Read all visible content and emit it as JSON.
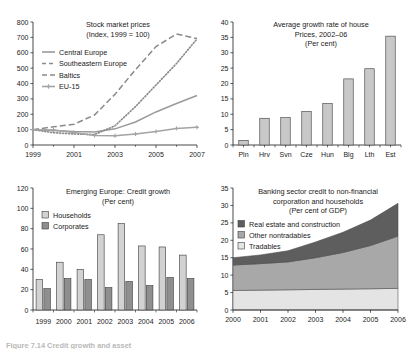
{
  "figure": {
    "caption_partial": "Figure 7.14   Credit growth and asset"
  },
  "chart_data": [
    {
      "id": "stock-market-prices",
      "type": "line",
      "title": "Stock market prices",
      "subtitle": "(Index, 1999 = 100)",
      "xlabel": "",
      "ylabel": "",
      "ylim": [
        0,
        800
      ],
      "yticks": [
        0,
        100,
        200,
        300,
        400,
        500,
        600,
        700,
        800
      ],
      "xlim": [
        1999,
        2007
      ],
      "xticks": [
        1999,
        2001,
        2003,
        2005,
        2007
      ],
      "x_minor": [
        2000,
        2002,
        2004,
        2006
      ],
      "grid": false,
      "legend_position": "upper-left",
      "x": [
        1999,
        2000,
        2001,
        2002,
        2003,
        2004,
        2005,
        2006,
        2007
      ],
      "series": [
        {
          "name": "Central Europe",
          "style": "solid",
          "color": "#9a9a9a",
          "values": [
            100,
            95,
            88,
            85,
            105,
            150,
            215,
            270,
            322
          ]
        },
        {
          "name": "Southeastern Europe",
          "style": "dotted",
          "color": "#8c8c8c",
          "values": [
            100,
            80,
            72,
            68,
            125,
            250,
            390,
            530,
            690
          ]
        },
        {
          "name": "Baltics",
          "style": "dashed",
          "color": "#8a8a8a",
          "values": [
            100,
            118,
            135,
            195,
            330,
            490,
            640,
            722,
            692
          ]
        },
        {
          "name": "EU-15",
          "style": "marker-line",
          "color": "#a3a3a3",
          "values": [
            100,
            98,
            82,
            62,
            60,
            72,
            88,
            108,
            115
          ]
        }
      ]
    },
    {
      "id": "house-price-growth",
      "type": "bar",
      "title": "Average growth rate of house",
      "subtitle": "Prices, 2002–06",
      "subtitle2": "(Per cent)",
      "xlabel": "",
      "ylabel": "",
      "ylim": [
        0,
        40
      ],
      "yticks": [
        0,
        5,
        10,
        15,
        20,
        25,
        30,
        35,
        40
      ],
      "grid": false,
      "bar_color": "#c8c8c8",
      "categories": [
        "Pln",
        "Hrv",
        "Svn",
        "Cze",
        "Hun",
        "Blg",
        "Lth",
        "Est"
      ],
      "values": [
        1.5,
        8.7,
        8.9,
        10.9,
        13.5,
        21.5,
        24.8,
        35.4
      ]
    },
    {
      "id": "emerging-europe-credit-growth",
      "type": "bar",
      "title": "Emerging Europe: Credit growth",
      "subtitle": "(Per cent)",
      "xlabel": "",
      "ylabel": "",
      "ylim": [
        0,
        120
      ],
      "yticks": [
        0,
        20,
        40,
        60,
        80,
        100,
        120
      ],
      "grid": false,
      "legend_position": "upper-left",
      "categories": [
        "1999",
        "2000",
        "2001",
        "2002",
        "2003",
        "2004",
        "2005",
        "2006"
      ],
      "series": [
        {
          "name": "Households",
          "color": "#d2d2d2",
          "values": [
            30,
            47,
            40,
            74,
            85,
            63,
            62,
            54
          ]
        },
        {
          "name": "Corporates",
          "color": "#8f8f8f",
          "values": [
            21,
            31,
            30,
            22,
            28,
            24,
            32,
            31
          ]
        }
      ]
    },
    {
      "id": "banking-sector-credit",
      "type": "area",
      "title": "Banking sector credit to non-financial",
      "subtitle": "corporation and households",
      "subtitle2": "(Per cent of GDP)",
      "xlabel": "",
      "ylabel": "",
      "ylim": [
        0,
        35
      ],
      "yticks": [
        0,
        5,
        10,
        15,
        20,
        25,
        30,
        35
      ],
      "grid": false,
      "legend_position": "upper-left",
      "stacked": true,
      "x": [
        2000,
        2001,
        2002,
        2003,
        2004,
        2005,
        2006
      ],
      "xticks": [
        2000,
        2001,
        2002,
        2003,
        2004,
        2005,
        2006
      ],
      "series": [
        {
          "name": "Tradables",
          "color": "#e4e4e4",
          "values": [
            5.6,
            5.7,
            5.8,
            5.9,
            6.0,
            6.1,
            6.2
          ]
        },
        {
          "name": "Other nontradables",
          "color": "#a8a8a8",
          "values": [
            7.3,
            7.6,
            8.0,
            9.1,
            10.5,
            12.4,
            15.0
          ]
        },
        {
          "name": "Real estate and construction",
          "color": "#5e5e5e",
          "values": [
            2.1,
            2.5,
            3.2,
            4.5,
            5.8,
            7.3,
            9.4
          ]
        }
      ]
    }
  ]
}
